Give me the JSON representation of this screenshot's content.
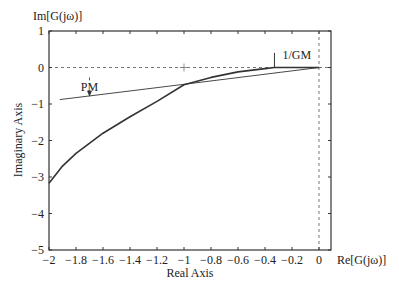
{
  "chart_data": {
    "type": "line",
    "title": "",
    "xlabel": "Real Axis",
    "ylabel": "Imaginary Axis",
    "x_axis_end_label": "Re[G(jω)]",
    "y_axis_top_label": "Im[G(jω)]",
    "xlim": [
      -2,
      0.09
    ],
    "ylim": [
      -5,
      1
    ],
    "xticks": [
      -2,
      -1.8,
      -1.6,
      -1.4,
      -1.2,
      -1,
      -0.8,
      -0.6,
      -0.4,
      -0.2,
      0
    ],
    "xtick_labels": [
      "−2",
      "−1.8",
      "−1.6",
      "−1.4",
      "−1.2",
      "−1",
      "−0.8",
      "−0.6",
      "−0.4",
      "−0.2",
      "0"
    ],
    "yticks": [
      1,
      0,
      -1,
      -2,
      -3,
      -4,
      -5
    ],
    "ytick_labels": [
      "1",
      "0",
      "−1",
      "−2",
      "−3",
      "−4",
      "−5"
    ],
    "grid": false,
    "reference_lines": [
      {
        "type": "horizontal",
        "y": 0,
        "style": "dashed"
      },
      {
        "type": "vertical",
        "x": 0,
        "style": "dashed"
      }
    ],
    "critical_point": {
      "x": -1,
      "y": 0,
      "marker": "+"
    },
    "series": [
      {
        "name": "Nyquist curve G(jω)",
        "style": "thick",
        "x": [
          -2.0,
          -1.9,
          -1.8,
          -1.6,
          -1.4,
          -1.2,
          -1.0,
          -0.8,
          -0.6,
          -0.4,
          -0.33,
          -0.2,
          -0.1,
          0.0
        ],
        "y": [
          -3.17,
          -2.7,
          -2.35,
          -1.8,
          -1.35,
          -0.93,
          -0.47,
          -0.27,
          -0.12,
          -0.03,
          0.0,
          0.0,
          0.0,
          0.0
        ]
      },
      {
        "name": "Line from origin through unit-circle crossing",
        "style": "thin",
        "x": [
          -1.92,
          -1.0,
          0.0
        ],
        "y": [
          -0.88,
          -0.46,
          0.0
        ]
      }
    ],
    "annotations": [
      {
        "text": "PM",
        "x": -1.7,
        "y": -0.6,
        "arrow_to": {
          "x": -1.7,
          "y": -0.8
        }
      },
      {
        "text": "1/GM",
        "x": -0.2,
        "y": 0.35,
        "marker_line": {
          "x": -0.33,
          "y_from": 0.0,
          "y_to": 0.4
        }
      }
    ]
  }
}
